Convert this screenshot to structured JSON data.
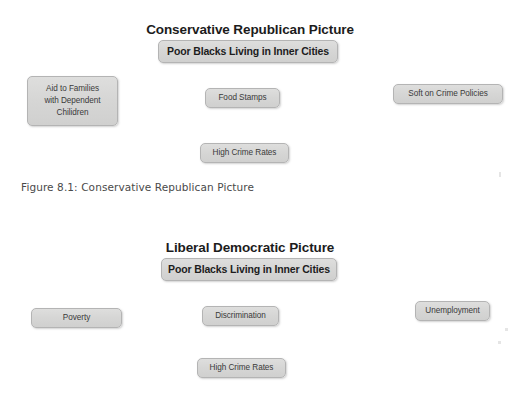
{
  "page": {
    "background_color": "#ffffff",
    "node_fill_color": "#d8d8d8",
    "node_border_color": "#b4b4b4",
    "text_color": "#2b2b2b",
    "top_edge_artifact": "",
    "mid_edge_artifact": ""
  },
  "diagrams": [
    {
      "id": "conservative-republican-picture",
      "title": "Conservative Republican Picture",
      "center_node": "Poor  Blacks Living in Inner Cities",
      "nodes": [
        {
          "name": "aid-to-families",
          "lines": [
            "Aid to Families",
            "with Dependent",
            "Chilidren"
          ]
        },
        {
          "name": "food-stamps",
          "lines": [
            "Food Stamps"
          ]
        },
        {
          "name": "soft-on-crime-policies",
          "lines": [
            "Soft on Crime Policies"
          ]
        },
        {
          "name": "high-crime-rates",
          "lines": [
            "High Crime Rates"
          ]
        }
      ],
      "caption": "Figure 8.1: Conservative Republican Picture"
    },
    {
      "id": "liberal-democratic-picture",
      "title": "Liberal Democratic Picture",
      "center_node": "Poor  Blacks Living in Inner Cities",
      "nodes": [
        {
          "name": "poverty",
          "lines": [
            "Poverty"
          ]
        },
        {
          "name": "discrimination",
          "lines": [
            "Discrimination"
          ]
        },
        {
          "name": "unemployment",
          "lines": [
            "Unemployment"
          ]
        },
        {
          "name": "high-crime-rates",
          "lines": [
            "High Crime Rates"
          ]
        }
      ],
      "caption": ""
    }
  ]
}
